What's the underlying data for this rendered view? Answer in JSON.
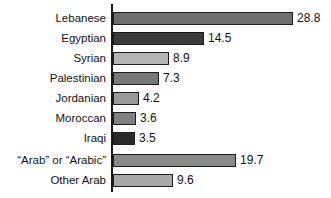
{
  "chart_data": {
    "type": "bar",
    "orientation": "horizontal",
    "title": "",
    "subtitle": "",
    "xlabel": "",
    "ylabel": "",
    "grid": false,
    "legend": false,
    "xlim": [
      0,
      28.8
    ],
    "categories": [
      "Lebanese",
      "Egyptian",
      "Syrian",
      "Palestinian",
      "Jordanian",
      "Moroccan",
      "Iraqi",
      "“Arab” or “Arabic”",
      "Other Arab"
    ],
    "values": [
      28.8,
      14.5,
      8.9,
      7.3,
      4.2,
      3.6,
      3.5,
      19.7,
      9.6
    ],
    "value_labels": [
      "28.8",
      "14.5",
      "8.9",
      "7.3",
      "4.2",
      "3.6",
      "3.5",
      "19.7",
      "9.6"
    ],
    "bar_colors": [
      "#6e6e6e",
      "#3c3c3c",
      "#b4b4b4",
      "#787878",
      "#9a9a9a",
      "#808080",
      "#2a2a2a",
      "#8a8a8a",
      "#a8a8a8"
    ],
    "bar_outline_color": "#1c1c1c",
    "axis_color": "#1a1a1a",
    "background_color": "#ffffff",
    "text_color": "#111111"
  }
}
